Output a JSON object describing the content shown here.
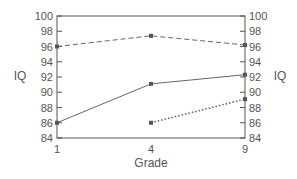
{
  "chart_data": {
    "type": "line",
    "title": "",
    "xlabel": "Grade",
    "ylabel": "IQ",
    "ylabel_right": "IQ",
    "categories": [
      "1",
      "4",
      "9"
    ],
    "ylim": [
      84,
      100
    ],
    "yticks": [
      84,
      86,
      88,
      90,
      92,
      94,
      96,
      98,
      100
    ],
    "grid": false,
    "legend": null,
    "series": [
      {
        "name": "dashed series",
        "style": "dashed",
        "values": [
          96.0,
          97.4,
          96.2
        ]
      },
      {
        "name": "solid series",
        "style": "solid",
        "values": [
          86.0,
          91.1,
          92.3
        ]
      },
      {
        "name": "dotted series",
        "style": "dotted",
        "values": [
          null,
          86.0,
          89.1
        ]
      }
    ]
  },
  "colors": {
    "line": "#666666",
    "marker": "#555555",
    "frame": "#555555",
    "text": "#555555"
  }
}
